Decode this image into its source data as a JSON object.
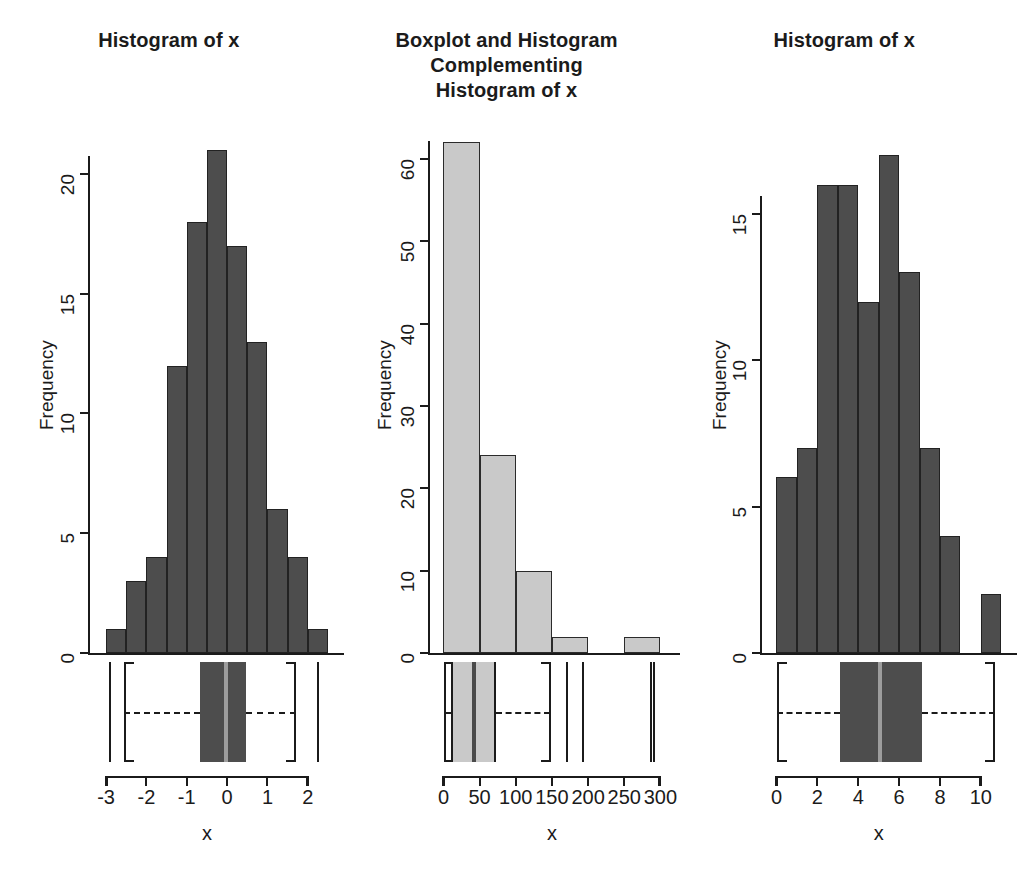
{
  "figure": {
    "background": "#ffffff",
    "width": 1013,
    "height": 871,
    "panel_count": 3
  },
  "panels": [
    {
      "title": "Histogram of x",
      "xlabel": "x",
      "ylabel": "Frequency",
      "bar_color": "#4d4d4d",
      "bar_border": "#222222"
    },
    {
      "title": "Boxplot and Histogram\nComplementing\nHistogram of x",
      "xlabel": "x",
      "ylabel": "Frequency",
      "bar_color": "#c9c9c9",
      "bar_border": "#2b2b2b"
    },
    {
      "title": "Histogram of x",
      "xlabel": "x",
      "ylabel": "Frequency",
      "bar_color": "#4d4d4d",
      "bar_border": "#222222"
    }
  ],
  "chart_data": [
    {
      "type": "bar",
      "title": "Histogram of x",
      "xlabel": "x",
      "ylabel": "Frequency",
      "grid": false,
      "legend": "none",
      "bin_edges": [
        -3.0,
        -2.5,
        -2.0,
        -1.5,
        -1.0,
        -0.5,
        0.0,
        0.5,
        1.0,
        1.5,
        2.0,
        2.5
      ],
      "categories": [
        "-3.0--2.5",
        "-2.5--2.0",
        "-2.0--1.5",
        "-1.5--1.0",
        "-1.0--0.5",
        "-0.5-0.0",
        "0.0-0.5",
        "0.5-1.0",
        "1.0-1.5",
        "1.5-2.0",
        "2.0-2.5"
      ],
      "values": [
        1,
        3,
        4,
        12,
        18,
        21,
        17,
        13,
        6,
        4,
        1
      ],
      "xlim": [
        -3.2,
        2.6
      ],
      "ylim": [
        0,
        22
      ],
      "xticks": [
        -3,
        -2,
        -1,
        0,
        1,
        2
      ],
      "xticklabels": [
        "-3",
        "-2",
        "-1",
        "0",
        "1",
        "2"
      ],
      "yticks": [
        0,
        5,
        10,
        15,
        20
      ],
      "yticklabels": [
        "0",
        "5",
        "10",
        "15",
        "20"
      ],
      "boxplot": {
        "min": -2.93,
        "q1": -0.68,
        "median": -0.03,
        "q3": 0.47,
        "max": 2.24,
        "whisker_low": -2.55,
        "whisker_high": 1.72,
        "outliers": [
          -2.93,
          2.24
        ],
        "box_color": "#4d4d4d",
        "median_color": "#9d9d9d"
      }
    },
    {
      "type": "bar",
      "title": "Boxplot and Histogram Complementing Histogram of x",
      "xlabel": "x",
      "ylabel": "Frequency",
      "grid": false,
      "legend": "none",
      "bin_edges": [
        0,
        50,
        100,
        150,
        200,
        250,
        300
      ],
      "categories": [
        "0-50",
        "50-100",
        "100-150",
        "150-200",
        "200-250",
        "250-300"
      ],
      "values": [
        62,
        24,
        10,
        2,
        0,
        2
      ],
      "xlim": [
        -8,
        310
      ],
      "ylim": [
        0,
        64
      ],
      "xticks": [
        0,
        50,
        100,
        150,
        200,
        250,
        300
      ],
      "xticklabels": [
        "0",
        "50",
        "100",
        "150",
        "200",
        "250",
        "300"
      ],
      "yticks": [
        0,
        10,
        20,
        30,
        40,
        50,
        60
      ],
      "yticklabels": [
        "0",
        "10",
        "20",
        "30",
        "40",
        "50",
        "60"
      ],
      "boxplot": {
        "min": 0.5,
        "q1": 11,
        "median": 42,
        "q3": 72,
        "max": 292,
        "whisker_low": 0.5,
        "whisker_high": 148,
        "outliers": [
          170,
          192,
          285,
          290
        ],
        "box_color": "#c9c9c9",
        "median_color": "#4a4a4a"
      }
    },
    {
      "type": "bar",
      "title": "Histogram of x",
      "xlabel": "x",
      "ylabel": "Frequency",
      "grid": false,
      "legend": "none",
      "bin_edges": [
        0,
        1,
        2,
        3,
        4,
        5,
        6,
        7,
        8,
        9,
        10,
        11
      ],
      "categories": [
        "0-1",
        "1-2",
        "2-3",
        "3-4",
        "4-5",
        "5-6",
        "6-7",
        "7-8",
        "8-9",
        "9-10",
        "10-11"
      ],
      "values": [
        6,
        7,
        16,
        16,
        12,
        17,
        13,
        7,
        4,
        0,
        2
      ],
      "xlim": [
        -0.3,
        11.2
      ],
      "ylim": [
        0,
        18
      ],
      "xticks": [
        0,
        2,
        4,
        6,
        8,
        10
      ],
      "xticklabels": [
        "0",
        "2",
        "4",
        "6",
        "8",
        "10"
      ],
      "yticks": [
        0,
        5,
        10,
        15
      ],
      "yticklabels": [
        "0",
        "5",
        "10",
        "15"
      ],
      "boxplot": {
        "min": 0.05,
        "q1": 3.1,
        "median": 5.05,
        "q3": 7.1,
        "max": 10.7,
        "whisker_low": 0.05,
        "whisker_high": 10.7,
        "outliers": [],
        "box_color": "#4d4d4d",
        "median_color": "#9d9d9d"
      }
    }
  ]
}
